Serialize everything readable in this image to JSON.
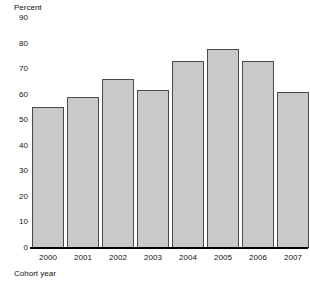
{
  "chart_data": {
    "type": "bar",
    "title": "",
    "subtitle": "",
    "xlabel": "Cohort year",
    "ylabel": "Percent",
    "categories": [
      "2000",
      "2001",
      "2002",
      "2003",
      "2004",
      "2005",
      "2006",
      "2007"
    ],
    "values": [
      55,
      59,
      66,
      62,
      73,
      78,
      73,
      61
    ],
    "series": [
      {
        "name": "Percent",
        "values": [
          55,
          59,
          66,
          62,
          73,
          78,
          73,
          61
        ]
      }
    ],
    "ylim": [
      0,
      90
    ],
    "ytick_labels": [
      "90",
      "80",
      "70",
      "60",
      "50",
      "40",
      "30",
      "20",
      "10",
      "0"
    ],
    "ytick_values": [
      90,
      80,
      70,
      60,
      50,
      40,
      30,
      20,
      10,
      0
    ],
    "ytick_step": 10,
    "grid": false,
    "legend": false,
    "legend_position": "none",
    "annotations": [],
    "colors": {
      "bar_fill": "#c9c9c9",
      "bar_edge": "#4a4a4a",
      "axis": "#000000",
      "text": "#111111",
      "background": "#ffffff"
    }
  }
}
